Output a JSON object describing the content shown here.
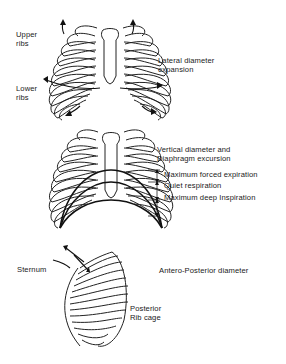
{
  "figure": {
    "panels": [
      {
        "id": "lateral",
        "title": "Lateral diameter\nexpansion",
        "labels": {
          "upper_ribs": "Upper\nribs",
          "lower_ribs": "Lower\nribs"
        }
      },
      {
        "id": "vertical",
        "title": "Vertical diameter and\nDiaphragm excursion",
        "levels": [
          "Maximum forced expiration",
          "Quiet respiration",
          "Maximum deep Inspiration"
        ]
      },
      {
        "id": "antero-posterior",
        "title": "Antero-Posterior diameter",
        "labels": {
          "sternum": "Sternum",
          "posterior": "Posterior\nRib cage"
        }
      }
    ],
    "colors": {
      "ink": "#1a1a1a",
      "background": "#ffffff"
    }
  }
}
